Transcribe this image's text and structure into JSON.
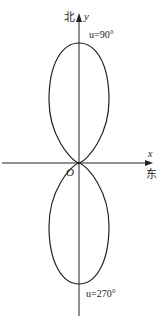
{
  "figure": {
    "type": "polar-radiation-pattern",
    "axes": {
      "y_label": "y",
      "y_direction_label": "北",
      "x_label": "x",
      "x_direction_label": "东",
      "origin_label": "O"
    },
    "annotations": {
      "top": "u=90°",
      "bottom": "u=270°"
    },
    "lobes": [
      {
        "name": "upper",
        "direction": "north",
        "angle": "90°"
      },
      {
        "name": "lower",
        "direction": "south",
        "angle": "270°"
      }
    ],
    "colors": {
      "stroke": "#222222",
      "background": "#ffffff"
    }
  }
}
